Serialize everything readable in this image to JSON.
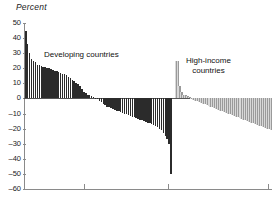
{
  "axis_title": "Percent",
  "labels": {
    "developing": "Developing countries",
    "high_income": "High-income\ncountries",
    "high_income_line1": "High-income",
    "high_income_line2": "countries"
  },
  "colors": {
    "developing_bar": "#2b2b2b",
    "high_income_bar": "#9a9a9a",
    "axis": "#8a8a8a",
    "zero_line": "#555555",
    "text": "#1a1a1a"
  },
  "chart_data": {
    "type": "bar",
    "title": "",
    "subtitle": "",
    "xlabel": "",
    "ylabel": "Percent",
    "ylim": [
      -60,
      50
    ],
    "yticks": [
      50,
      40,
      30,
      20,
      10,
      0,
      -10,
      -20,
      -30,
      -40,
      -50,
      -60
    ],
    "ytick_labels": [
      "50",
      "40",
      "30",
      "20",
      "10",
      "0",
      "-10",
      "-20",
      "-30",
      "-40",
      "-50",
      "-60"
    ],
    "grid": false,
    "legend_position": "none",
    "annotations": [
      {
        "text": "Developing countries",
        "x_frac": 0.2,
        "y_value": 27
      },
      {
        "text": "High-income countries",
        "x_frac": 0.72,
        "y_value": 23
      }
    ],
    "series": [
      {
        "name": "Developing countries",
        "color": "#2b2b2b",
        "values": [
          45,
          36,
          30,
          26,
          25,
          24,
          22,
          22,
          21.5,
          21,
          21,
          20.5,
          20,
          19.5,
          19,
          18.5,
          18,
          17.5,
          17,
          16.5,
          16,
          15.5,
          14.5,
          13.5,
          12.5,
          11.5,
          10.5,
          9.5,
          8,
          6,
          4.5,
          3.5,
          2.5,
          2,
          1.5,
          1,
          0.5,
          -0.5,
          -1.5,
          -2.5,
          -3.5,
          -4.5,
          -5.5,
          -6,
          -6.5,
          -7,
          -7.5,
          -8,
          -8.5,
          -9,
          -9.5,
          -10,
          -10.5,
          -11,
          -11.5,
          -12,
          -12.5,
          -13,
          -13.5,
          -14,
          -14.5,
          -15,
          -15.5,
          -16,
          -16.5,
          -17,
          -17.5,
          -18,
          -19,
          -20,
          -21,
          -23,
          -25,
          -27,
          -30,
          -50
        ]
      },
      {
        "name": "High-income countries",
        "color": "#9a9a9a",
        "values": [
          25,
          25,
          8,
          4,
          2.5,
          2,
          1.5,
          1,
          -0.5,
          -1,
          -1.5,
          -2,
          -2.5,
          -3,
          -3.5,
          -4,
          -4.5,
          -5,
          -5.5,
          -6,
          -6.5,
          -7,
          -7.5,
          -8,
          -8.5,
          -9,
          -9.5,
          -10,
          -10.5,
          -11,
          -11.5,
          -12,
          -12.5,
          -13,
          -13.5,
          -14,
          -14.5,
          -15,
          -15.5,
          -16,
          -16.5,
          -17,
          -17.5,
          -18,
          -18.5,
          -19,
          -19.5,
          -20,
          -20.5,
          -21
        ]
      }
    ]
  }
}
